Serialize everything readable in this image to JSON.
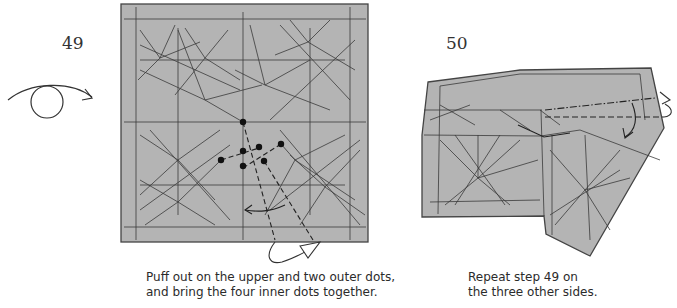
{
  "steps": [
    {
      "number": "49",
      "caption_line1": "Puff out on the upper and two outer dots,",
      "caption_line2": "and bring the four inner dots together.",
      "symbols": [
        "turn-over-icon",
        "puff-arrow",
        "valley-fold-lines",
        "dots"
      ]
    },
    {
      "number": "50",
      "caption_line1": "Repeat step 49 on",
      "caption_line2": "the three other sides.",
      "symbols": [
        "fold-arrow",
        "mountain-fold-line",
        "valley-fold-line",
        "push-arrow"
      ]
    }
  ],
  "colors": {
    "paper": "#b4b4b4",
    "line": "#3a3a3a",
    "background": "#ffffff"
  }
}
